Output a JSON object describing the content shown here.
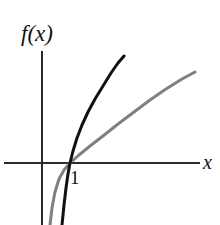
{
  "figure": {
    "name": "exponential-and-logarithm-graph",
    "background_color": "#ffffff",
    "width": 220,
    "height": 225
  },
  "labels": {
    "y_axis_label": "f(x)",
    "x_axis_label": "x",
    "tick_label_one": "1"
  },
  "chart_data": {
    "type": "line",
    "title": "",
    "xlabel": "x",
    "ylabel": "f(x)",
    "grid": false,
    "legend": null,
    "axes": {
      "origin_px": [
        42,
        163
      ],
      "x_axis_y_px": 163,
      "y_axis_x_px": 42,
      "x_axis_extent_px": [
        4,
        200
      ],
      "y_axis_extent_px": [
        51,
        225
      ],
      "axis_color": "#2b2b2b",
      "axis_width_px": 2
    },
    "annotations": [
      {
        "text": "1",
        "position_px": [
          70,
          178
        ],
        "describes": "x-intercept of both curves at x = 1"
      }
    ],
    "series": [
      {
        "name": "exponential-curve",
        "color": "#111111",
        "width_px": 3,
        "description": "steeply rising curve, concave up, crosses x-axis at x = 1",
        "points_px": [
          [
            62,
            225
          ],
          [
            64,
            205
          ],
          [
            66,
            188
          ],
          [
            68,
            174
          ],
          [
            70,
            163
          ],
          [
            73,
            151
          ],
          [
            77,
            138
          ],
          [
            82,
            125
          ],
          [
            88,
            112
          ],
          [
            95,
            99
          ],
          [
            103,
            86
          ],
          [
            111,
            73
          ],
          [
            118,
            63
          ],
          [
            124,
            56
          ]
        ]
      },
      {
        "name": "logarithm-curve",
        "color": "#808080",
        "width_px": 3,
        "description": "gradually rising curve, concave down, crosses x-axis at x = 1",
        "points_px": [
          [
            50,
            225
          ],
          [
            52,
            208
          ],
          [
            55,
            192
          ],
          [
            59,
            179
          ],
          [
            64,
            170
          ],
          [
            70,
            163
          ],
          [
            79,
            155
          ],
          [
            90,
            146
          ],
          [
            103,
            136
          ],
          [
            118,
            124
          ],
          [
            134,
            112
          ],
          [
            150,
            100
          ],
          [
            166,
            89
          ],
          [
            182,
            79
          ],
          [
            195,
            72
          ]
        ]
      }
    ]
  }
}
